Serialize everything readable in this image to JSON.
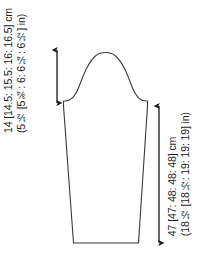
{
  "diagram": {
    "type": "sleeve-schematic",
    "background_color": "#ffffff",
    "line_color": "#3a3a3a",
    "text_color": "#1a1a1a"
  },
  "measurements": {
    "cap_depth": {
      "name": "sleeve-cap-depth",
      "metric": "14 [14.5: 15.5: 16: 16.5] cm",
      "imperial": "(5½ [5¾: 6: 6¼: 6½] in)",
      "base_value": 14,
      "unit": "cm",
      "sizes_cm": [
        14,
        14.5,
        15.5,
        16,
        16.5
      ],
      "sizes_in": [
        "5½",
        "5¾",
        "6",
        "6¼",
        "6½"
      ]
    },
    "sleeve_length": {
      "name": "sleeve-length",
      "metric": "47 [47: 48: 48: 48] cm",
      "imperial": "(18½ [18½: 19: 19: 19] in)",
      "base_value": 47,
      "unit": "cm",
      "sizes_cm": [
        47,
        47,
        48,
        48,
        48
      ],
      "sizes_in": [
        "18½",
        "18½",
        "19",
        "19",
        "19"
      ]
    }
  },
  "arrows": {
    "cap_arrow": {
      "name": "cap-depth-arrow",
      "orientation": "vertical",
      "double_headed": true
    },
    "length_arrow": {
      "name": "sleeve-length-arrow",
      "orientation": "vertical",
      "double_headed": true
    }
  }
}
